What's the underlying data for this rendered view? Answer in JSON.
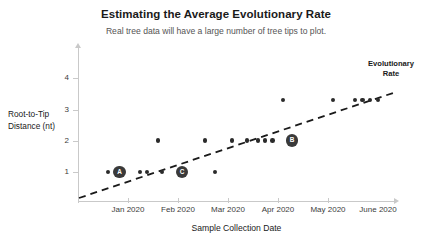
{
  "chart_data": {
    "type": "scatter",
    "title": "Estimating the Average Evolutionary Rate",
    "subtitle": "Real tree data will have a large number of tree tips to plot.",
    "xlabel": "Sample Collection Date",
    "ylabel": "Root-to-Tip Distance (nt)",
    "ylabel_line1": "Root-to-Tip",
    "ylabel_line2": "Distance (nt)",
    "grid": false,
    "legend": "none",
    "xticks": [
      "Jan 2020",
      "Feb 2020",
      "Mar 2020",
      "Apr 2020",
      "May 2020",
      "June 2020"
    ],
    "yticks": [
      "1",
      "2",
      "3",
      "4"
    ],
    "ylim": [
      0,
      4.6
    ],
    "annotations": [
      {
        "text": "Evolutionary Rate",
        "line1": "Evolutionary",
        "line2": "Rate",
        "target": "trendline"
      }
    ],
    "trendline": {
      "style": "dashed",
      "color": "#1a1a1a",
      "x_start": "Jan 2020",
      "y_start": 0.08,
      "x_end": "after June 2020",
      "y_end": 3.35
    },
    "points": [
      {
        "x": "2020-01-05",
        "y": 1.0,
        "label": "",
        "size": "small"
      },
      {
        "x": "2020-01-12",
        "y": 1.0,
        "label": "A",
        "size": "large"
      },
      {
        "x": "2020-01-28",
        "y": 1.0,
        "label": "",
        "size": "small"
      },
      {
        "x": "2020-02-01",
        "y": 1.0,
        "label": "",
        "size": "small"
      },
      {
        "x": "2020-02-12",
        "y": 1.0,
        "label": "",
        "size": "small"
      },
      {
        "x": "2020-02-08",
        "y": 2.0,
        "label": "",
        "size": "small"
      },
      {
        "x": "2020-02-24",
        "y": 1.0,
        "label": "C",
        "size": "large"
      },
      {
        "x": "2020-03-12",
        "y": 1.0,
        "label": "",
        "size": "small"
      },
      {
        "x": "2020-03-05",
        "y": 2.0,
        "label": "",
        "size": "small"
      },
      {
        "x": "2020-03-24",
        "y": 2.0,
        "label": "",
        "size": "small"
      },
      {
        "x": "2020-04-01",
        "y": 2.0,
        "label": "",
        "size": "small"
      },
      {
        "x": "2020-04-06",
        "y": 2.0,
        "label": "",
        "size": "small"
      },
      {
        "x": "2020-04-10",
        "y": 2.0,
        "label": "",
        "size": "small"
      },
      {
        "x": "2020-04-14",
        "y": 2.0,
        "label": "",
        "size": "small"
      },
      {
        "x": "2020-04-22",
        "y": 2.0,
        "label": "B",
        "size": "large"
      },
      {
        "x": "2020-04-18",
        "y": 3.0,
        "label": "",
        "size": "small"
      },
      {
        "x": "2020-05-22",
        "y": 3.0,
        "label": "",
        "size": "small"
      },
      {
        "x": "2020-06-02",
        "y": 3.0,
        "label": "",
        "size": "small"
      },
      {
        "x": "2020-06-06",
        "y": 3.0,
        "label": "",
        "size": "small"
      },
      {
        "x": "2020-06-11",
        "y": 3.0,
        "label": "",
        "size": "small"
      },
      {
        "x": "2020-06-16",
        "y": 3.0,
        "label": "",
        "size": "small"
      }
    ]
  },
  "pixel_layout": {
    "points": [
      {
        "px": 108,
        "py": 172,
        "label": "",
        "size": "small"
      },
      {
        "px": 119.5,
        "py": 172,
        "label": "A",
        "size": "large"
      },
      {
        "px": 140,
        "py": 172,
        "label": "",
        "size": "small"
      },
      {
        "px": 147,
        "py": 172,
        "label": "",
        "size": "small"
      },
      {
        "px": 162,
        "py": 172,
        "label": "",
        "size": "small"
      },
      {
        "px": 158,
        "py": 140.5,
        "label": "",
        "size": "small"
      },
      {
        "px": 182,
        "py": 172,
        "label": "C",
        "size": "large"
      },
      {
        "px": 215,
        "py": 172,
        "label": "",
        "size": "small"
      },
      {
        "px": 205,
        "py": 140.5,
        "label": "",
        "size": "small"
      },
      {
        "px": 232,
        "py": 140.5,
        "label": "",
        "size": "small"
      },
      {
        "px": 247,
        "py": 140.5,
        "label": "",
        "size": "small"
      },
      {
        "px": 258,
        "py": 140.5,
        "label": "",
        "size": "small"
      },
      {
        "px": 265,
        "py": 140.5,
        "label": "",
        "size": "small"
      },
      {
        "px": 272.5,
        "py": 140.5,
        "label": "",
        "size": "small"
      },
      {
        "px": 292,
        "py": 140.5,
        "label": "B",
        "size": "large"
      },
      {
        "px": 283,
        "py": 100,
        "label": "",
        "size": "small"
      },
      {
        "px": 333,
        "py": 100,
        "label": "",
        "size": "small"
      },
      {
        "px": 355,
        "py": 100,
        "label": "",
        "size": "small"
      },
      {
        "px": 362.5,
        "py": 100,
        "label": "",
        "size": "small"
      },
      {
        "px": 370,
        "py": 100,
        "label": "",
        "size": "small"
      },
      {
        "px": 378,
        "py": 100,
        "label": "",
        "size": "small"
      }
    ],
    "xticks": [
      78,
      128,
      178,
      228,
      278,
      328
    ],
    "xtick_label_centers": [
      128,
      178,
      228,
      278,
      328,
      378
    ],
    "yticks": [
      172,
      140.5,
      109.5,
      78
    ],
    "trendline": {
      "x1": 79,
      "y1": 198,
      "x2": 396,
      "y2": 92
    }
  }
}
